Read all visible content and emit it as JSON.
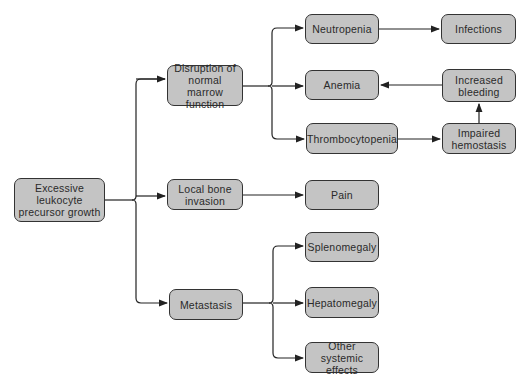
{
  "diagram": {
    "type": "flowchart",
    "colors": {
      "box_fill": "#c4c4c4",
      "box_border": "#333333",
      "line": "#222222",
      "text": "#2a2a2a"
    },
    "nodes": {
      "root": "Excessive\nleukocyte\nprecursor growth",
      "disruption": "Disruption of\nnormal marrow\nfunction",
      "local_bone": "Local bone\ninvasion",
      "metastasis": "Metastasis",
      "neutropenia": "Neutropenia",
      "anemia": "Anemia",
      "thrombocytopenia": "Thrombocytopenia",
      "infections": "Infections",
      "increased_bleeding": "Increased\nbleeding",
      "impaired_hemostasis": "Impaired\nhemostasis",
      "pain": "Pain",
      "splenomegaly": "Splenomegaly",
      "hepatomegaly": "Hepatomegaly",
      "other_systemic": "Other systemic\neffects"
    },
    "edges": [
      [
        "root",
        "disruption"
      ],
      [
        "root",
        "local_bone"
      ],
      [
        "root",
        "metastasis"
      ],
      [
        "disruption",
        "neutropenia"
      ],
      [
        "disruption",
        "anemia"
      ],
      [
        "disruption",
        "thrombocytopenia"
      ],
      [
        "neutropenia",
        "infections"
      ],
      [
        "thrombocytopenia",
        "impaired_hemostasis"
      ],
      [
        "impaired_hemostasis",
        "increased_bleeding"
      ],
      [
        "increased_bleeding",
        "anemia"
      ],
      [
        "local_bone",
        "pain"
      ],
      [
        "metastasis",
        "splenomegaly"
      ],
      [
        "metastasis",
        "hepatomegaly"
      ],
      [
        "metastasis",
        "other_systemic"
      ]
    ]
  }
}
